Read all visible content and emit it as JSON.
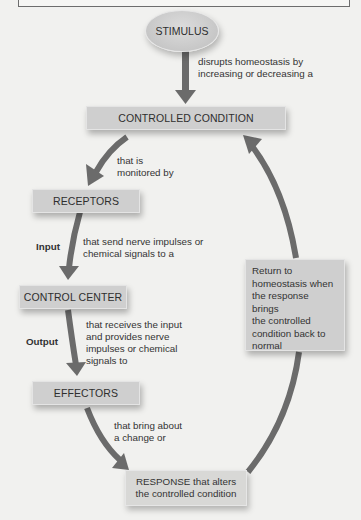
{
  "diagram": {
    "type": "negative-feedback-loop",
    "colors": {
      "background": "#f1f1ef",
      "box_fill": "#cfcfcf",
      "arrow": "#6b6b6b",
      "text": "#2e2e2e"
    },
    "nodes": {
      "stimulus": "STIMULUS",
      "controlled_condition": "CONTROLLED CONDITION",
      "receptors": "RECEPTORS",
      "control_center": "CONTROL CENTER",
      "effectors": "EFFECTORS",
      "response": {
        "line1": "RESPONSE that alters",
        "line2": "the controlled condition"
      }
    },
    "edges": {
      "stimulus_to_condition": {
        "line1": "disrupts homeostasis by",
        "line2": "increasing or decreasing a"
      },
      "condition_to_receptors": {
        "line1": "that is",
        "line2": "monitored by"
      },
      "receptors_to_control": {
        "tag": "Input",
        "line1": "that send nerve impulses or",
        "line2": "chemical signals to a"
      },
      "control_to_effectors": {
        "tag": "Output",
        "line1": "that receives the input",
        "line2": "and provides nerve",
        "line3": "impulses or chemical",
        "line4": "signals to"
      },
      "effectors_to_response": {
        "line1": "that bring about",
        "line2": "a change or"
      },
      "response_to_condition": {
        "line1": "Return to",
        "line2": "homeostasis when",
        "line3": "the response brings",
        "line4": "the controlled",
        "line5": "condition back to",
        "line6": "normal"
      }
    }
  }
}
